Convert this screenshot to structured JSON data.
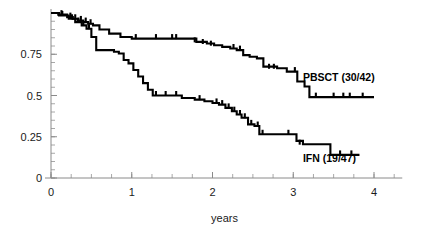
{
  "chart_data": {
    "type": "line",
    "title": "",
    "subtitle": "",
    "xlabel": "years",
    "ylabel": "",
    "xlim": [
      0,
      4.35
    ],
    "ylim": [
      0,
      1.0
    ],
    "xticks": [
      0,
      1,
      2,
      3,
      4
    ],
    "xticklabels": [
      "0",
      "1",
      "2",
      "3",
      "4"
    ],
    "xminor_step": 0.25,
    "yticks": [
      0,
      0.25,
      0.5,
      0.75
    ],
    "yticklabels": [
      "0",
      "0.25",
      "0.5",
      "0.75"
    ],
    "yminor_step": 0.05,
    "grid": false,
    "legend_position": "inline-annotations",
    "step_type": "post",
    "series": [
      {
        "name": "PBSCT (30/42)",
        "label": "PBSCT (30/42)",
        "color": "#000000",
        "events": "30/42",
        "label_x": 3.12,
        "label_y": 0.585,
        "x": [
          0,
          0.09,
          0.2,
          0.27,
          0.33,
          0.4,
          0.46,
          0.52,
          0.6,
          0.72,
          0.86,
          1.0,
          1.12,
          1.4,
          1.72,
          1.8,
          1.93,
          2.02,
          2.12,
          2.22,
          2.3,
          2.38,
          2.46,
          2.55,
          2.63,
          2.8,
          2.92,
          3.05,
          3.14,
          3.2,
          4.0
        ],
        "y": [
          1.0,
          0.99,
          0.975,
          0.965,
          0.955,
          0.945,
          0.935,
          0.925,
          0.9,
          0.875,
          0.855,
          0.845,
          0.845,
          0.845,
          0.845,
          0.825,
          0.815,
          0.805,
          0.795,
          0.785,
          0.775,
          0.745,
          0.735,
          0.725,
          0.675,
          0.665,
          0.645,
          0.585,
          0.555,
          0.49,
          0.49
        ],
        "censor_x": [
          0.13,
          0.24,
          0.3,
          0.37,
          0.43,
          0.49,
          1.05,
          1.3,
          1.5,
          1.55,
          1.78,
          1.88,
          1.98,
          2.26,
          2.34,
          2.7,
          2.76,
          3.02,
          3.28,
          3.5,
          3.62,
          3.7,
          3.86
        ],
        "censor_y": [
          0.99,
          0.975,
          0.965,
          0.955,
          0.945,
          0.935,
          0.845,
          0.845,
          0.845,
          0.845,
          0.825,
          0.815,
          0.805,
          0.785,
          0.775,
          0.665,
          0.665,
          0.645,
          0.49,
          0.49,
          0.49,
          0.49,
          0.49
        ]
      },
      {
        "name": "IFN (19/47)",
        "label": "IFN (19/47)",
        "color": "#000000",
        "events": "19/47",
        "label_x": 3.12,
        "label_y": 0.095,
        "x": [
          0,
          0.1,
          0.22,
          0.3,
          0.38,
          0.44,
          0.5,
          0.56,
          0.62,
          0.68,
          0.78,
          0.84,
          0.9,
          0.96,
          1.02,
          1.08,
          1.14,
          1.2,
          1.26,
          1.52,
          1.62,
          1.78,
          1.9,
          2.0,
          2.08,
          2.16,
          2.24,
          2.3,
          2.36,
          2.44,
          2.52,
          2.58,
          2.86,
          3.04,
          3.12,
          3.46,
          3.82
        ],
        "y": [
          1.0,
          0.985,
          0.965,
          0.945,
          0.925,
          0.905,
          0.855,
          0.775,
          0.775,
          0.775,
          0.765,
          0.755,
          0.715,
          0.695,
          0.655,
          0.615,
          0.575,
          0.535,
          0.5,
          0.5,
          0.485,
          0.475,
          0.465,
          0.455,
          0.445,
          0.425,
          0.405,
          0.385,
          0.365,
          0.325,
          0.315,
          0.265,
          0.265,
          0.225,
          0.205,
          0.14,
          0.14
        ],
        "censor_x": [
          0.14,
          0.26,
          0.34,
          0.4,
          0.47,
          1.3,
          1.42,
          1.55,
          1.84,
          2.05,
          2.12,
          2.2,
          2.27,
          2.34,
          2.4,
          2.48,
          2.56,
          2.62,
          2.94,
          3.08,
          3.58,
          3.72
        ],
        "censor_y": [
          0.985,
          0.965,
          0.945,
          0.925,
          0.905,
          0.5,
          0.5,
          0.5,
          0.475,
          0.455,
          0.445,
          0.425,
          0.405,
          0.385,
          0.365,
          0.325,
          0.315,
          0.265,
          0.265,
          0.205,
          0.14,
          0.14
        ]
      }
    ]
  }
}
